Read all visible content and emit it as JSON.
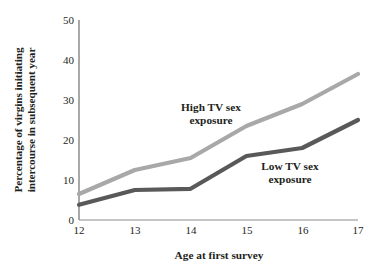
{
  "chart_data": {
    "type": "line",
    "title": "",
    "xlabel": "Age at first survey",
    "ylabel": "Percentage of virgins initiating intercourse in subsequent year",
    "ylabel_lines": [
      "Percentage of virgins initiating",
      "intercourse in subsequent year"
    ],
    "categories": [
      12,
      13,
      14,
      15,
      16,
      17
    ],
    "x": [
      12,
      13,
      14,
      15,
      16,
      17
    ],
    "xtick_labels": [
      "12",
      "13",
      "14",
      "15",
      "16",
      "17"
    ],
    "ytick_labels": [
      "0",
      "10",
      "20",
      "30",
      "40",
      "50"
    ],
    "ytick_values": [
      0,
      10,
      20,
      30,
      40,
      50
    ],
    "xlim": [
      12,
      17
    ],
    "ylim": [
      0,
      50
    ],
    "grid": false,
    "legend_position": "inline-annotations",
    "series": [
      {
        "name": "High TV sex exposure",
        "color": "#a8a8a8",
        "values": [
          6.5,
          12.5,
          15.5,
          23.5,
          29,
          36.5
        ]
      },
      {
        "name": "Low TV sex exposure",
        "color": "#595959",
        "values": [
          3.8,
          7.5,
          7.8,
          16,
          18,
          25
        ]
      }
    ],
    "annotations": [
      {
        "text_lines": [
          "High TV sex",
          "exposure"
        ],
        "series": "High TV sex exposure"
      },
      {
        "text_lines": [
          "Low TV sex",
          "exposure"
        ],
        "series": "Low TV sex exposure"
      }
    ],
    "axis_color": "#6f6f6f"
  }
}
